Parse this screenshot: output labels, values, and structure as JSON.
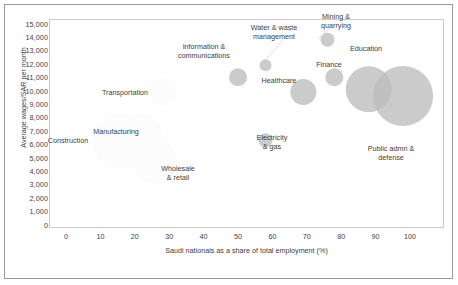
{
  "chart_data": {
    "type": "scatter",
    "title": "",
    "xlabel": "Saudi nationals as a share of total employment (%)",
    "ylabel": "Average wages/SAR per month",
    "xlim": [
      0,
      100
    ],
    "ylim": [
      0,
      15000
    ],
    "xticks": [
      "0",
      "10",
      "20",
      "30",
      "40",
      "50",
      "60",
      "70",
      "80",
      "90",
      "100"
    ],
    "yticks": [
      "15,000",
      "14,000",
      "13,000",
      "12,000",
      "11,000",
      "10,000",
      "9,000",
      "8,000",
      "7,000",
      "6,000",
      "5,000",
      "4,000",
      "3,000",
      "2,000",
      "1,000",
      "0"
    ],
    "grid": false,
    "legend": "none",
    "bubble_fill": "#bcbcbc",
    "bubble_fill_faint": "#fcfcfc",
    "points": [
      {
        "name": "Construction",
        "x": 16,
        "y": 6300,
        "size": 28,
        "faint": true,
        "label": "Construction",
        "label_x": 68,
        "label_y": 136
      },
      {
        "name": "Manufacturing",
        "x": 22,
        "y": 6900,
        "size": 20,
        "faint": true,
        "label": "Manufacturing",
        "label_x": 116,
        "label_y": 127
      },
      {
        "name": "Transportation",
        "x": 28,
        "y": 10000,
        "size": 14,
        "faint": true,
        "label": "Transportation",
        "label_x": 125,
        "label_y": 88
      },
      {
        "name": "Wholesale & retail",
        "x": 26,
        "y": 4800,
        "size": 22,
        "faint": true,
        "label": "Wholesale\n& retail",
        "label_x": 178,
        "label_y": 164
      },
      {
        "name": "Information & communications",
        "x": 50,
        "y": 11100,
        "size": 9,
        "faint": false,
        "label": "Information &\ncommunications",
        "label_x": 204,
        "label_y": 42
      },
      {
        "name": "Water & waste management",
        "x": 58,
        "y": 12000,
        "size": 6,
        "faint": false,
        "label": "Water & waste\nmanagement",
        "label_x": 274,
        "label_y": 23
      },
      {
        "name": "Healthcare",
        "x": 69,
        "y": 10000,
        "size": 13,
        "faint": false,
        "label": "Healthcare",
        "label_x": 279,
        "label_y": 76
      },
      {
        "name": "Electricity & gas",
        "x": 58,
        "y": 6400,
        "size": 7,
        "faint": false,
        "label": "Electricity\n& gas",
        "label_x": 272,
        "label_y": 133
      },
      {
        "name": "Mining & quarrying",
        "x": 76,
        "y": 13900,
        "size": 7,
        "faint": false,
        "label": "Mining &\nquarrying",
        "label_x": 336,
        "label_y": 12
      },
      {
        "name": "Finance",
        "x": 78,
        "y": 11100,
        "size": 9,
        "faint": false,
        "label": "Finance",
        "label_x": 329,
        "label_y": 60
      },
      {
        "name": "Education",
        "x": 88,
        "y": 10200,
        "size": 23,
        "faint": false,
        "label": "Education",
        "label_x": 366,
        "label_y": 44
      },
      {
        "name": "Public admn & defense",
        "x": 98,
        "y": 9700,
        "size": 30,
        "faint": false,
        "label": "Public admn &\ndefense",
        "label_x": 391,
        "label_y": 144
      }
    ]
  }
}
